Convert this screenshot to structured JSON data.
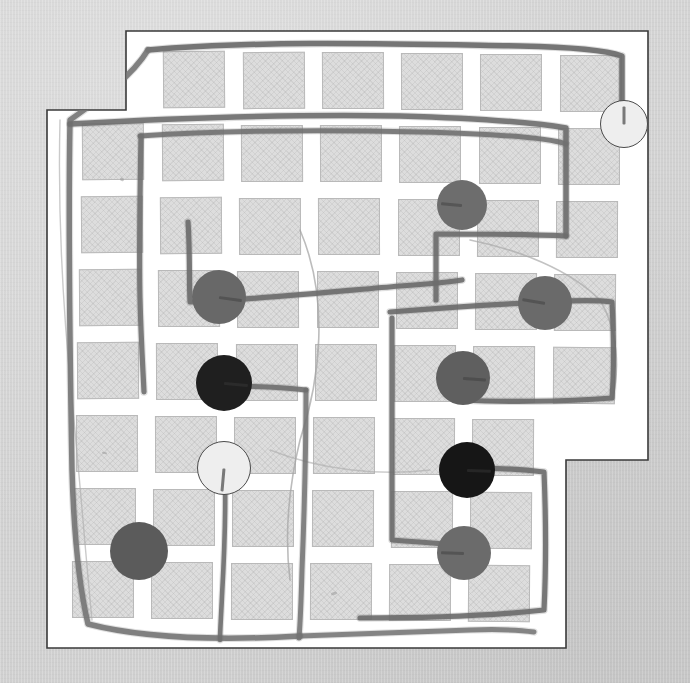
{
  "scene": {
    "title": "Hand-drawn grid map puzzle",
    "description": "Photograph of a white paper sheet on a gray surface showing a hatched city-block grid with pencil-drawn routes and colored game tokens placed at street intersections.",
    "canvas": {
      "width": 690,
      "height": 683
    },
    "backdrop_color": "#d3d3d3",
    "sheet_color": "#ffffff",
    "sheet_edge_color": "#3a3a3a",
    "block_fill": "#dddddd",
    "block_border": "#b9b9b9",
    "street_color": "#ffffff",
    "pencil_color": "#6f6f6f"
  },
  "sheet": {
    "label": "paper-sheet",
    "points": "126,31 648,31 648,460 566,460 566,648 47,648 47,110 126,110"
  },
  "grid": {
    "label": "city-block-grid",
    "columns": 7,
    "rows": 8,
    "origin_x": 84,
    "origin_y": 50,
    "cell_w": 79,
    "cell_h": 73,
    "block_w": 62,
    "block_h": 57,
    "skew_note": "blocks drift slightly left going down, mimicking a photographed page"
  },
  "tokens": [
    {
      "name": "token-white-top-right",
      "color": "#eeeeee",
      "outlined": true,
      "x": 624,
      "y": 124,
      "r": 24,
      "stub_deg": 270,
      "stub_len": 18,
      "order": 1
    },
    {
      "name": "token-gray-upper-mid",
      "color": "#6d6d6d",
      "outlined": false,
      "x": 462,
      "y": 205,
      "r": 25,
      "stub_deg": 185,
      "stub_len": 22,
      "order": 2
    },
    {
      "name": "token-gray-left-upper",
      "color": "#686868",
      "outlined": false,
      "x": 219,
      "y": 297,
      "r": 27,
      "stub_deg": 8,
      "stub_len": 26,
      "order": 3
    },
    {
      "name": "token-gray-right-mid",
      "color": "#6a6a6a",
      "outlined": false,
      "x": 545,
      "y": 303,
      "r": 27,
      "stub_deg": 190,
      "stub_len": 26,
      "order": 4
    },
    {
      "name": "token-black-left",
      "color": "#1f1f1f",
      "outlined": false,
      "x": 224,
      "y": 383,
      "r": 28,
      "stub_deg": 5,
      "stub_len": 26,
      "order": 5
    },
    {
      "name": "token-gray-right-low",
      "color": "#5f5f5f",
      "outlined": false,
      "x": 463,
      "y": 378,
      "r": 27,
      "stub_deg": 4,
      "stub_len": 26,
      "order": 6
    },
    {
      "name": "token-white-left-low",
      "color": "#eeeeee",
      "outlined": true,
      "x": 224,
      "y": 468,
      "r": 27,
      "stub_deg": 95,
      "stub_len": 24,
      "order": 7
    },
    {
      "name": "token-black-right-low",
      "color": "#161616",
      "outlined": false,
      "x": 467,
      "y": 470,
      "r": 28,
      "stub_deg": 2,
      "stub_len": 26,
      "order": 8
    },
    {
      "name": "token-gray-bottom-left",
      "color": "#5b5b5b",
      "outlined": false,
      "x": 139,
      "y": 551,
      "r": 29,
      "stub_deg": 0,
      "stub_len": 0,
      "order": 9
    },
    {
      "name": "token-gray-bottom-mid",
      "color": "#6b6b6b",
      "outlined": false,
      "x": 464,
      "y": 553,
      "r": 27,
      "stub_deg": 182,
      "stub_len": 26,
      "order": 10
    }
  ],
  "routes": [
    {
      "name": "route-outer-loop",
      "stroke": "#6b6b6b",
      "width": 5.5,
      "opacity": 0.92,
      "d": "M148,50 C260,40 400,44 520,46 C570,47 605,50 622,56 L622,110"
    },
    {
      "name": "route-left-spine",
      "stroke": "#757575",
      "width": 5.5,
      "opacity": 0.9,
      "d": "M148,50 C132,76 104,96 70,120 C68,230 70,360 72,470 C74,540 80,590 88,624 C150,640 230,640 300,636"
    },
    {
      "name": "route-upper-horizontal",
      "stroke": "#6e6e6e",
      "width": 5.5,
      "opacity": 0.9,
      "d": "M70,124 C180,118 300,114 400,116 C470,118 530,122 566,128 L566,236"
    },
    {
      "name": "route-second-horizontal",
      "stroke": "#6f6f6f",
      "width": 5.0,
      "opacity": 0.88,
      "d": "M140,136 C230,130 340,130 420,132 C500,134 548,138 566,144"
    },
    {
      "name": "route-col2-vertical",
      "stroke": "#707070",
      "width": 5.2,
      "opacity": 0.9,
      "d": "M141,136 C140,190 139,250 140,298 C141,340 143,370 144,392"
    },
    {
      "name": "route-mid-hook",
      "stroke": "#6c6c6c",
      "width": 5.2,
      "opacity": 0.9,
      "d": "M188,222 C190,250 189,280 190,302 C250,300 330,292 400,286 C430,284 450,282 462,280"
    },
    {
      "name": "route-right-upper-box",
      "stroke": "#6d6d6d",
      "width": 5.2,
      "opacity": 0.9,
      "d": "M566,236 C520,234 470,234 436,234 L436,300"
    },
    {
      "name": "route-right-mid-band",
      "stroke": "#6a6a6a",
      "width": 5.2,
      "opacity": 0.9,
      "d": "M390,312 C440,308 500,304 548,302 C580,300 598,300 612,302 C614,340 614,372 612,398 C560,402 500,402 462,400"
    },
    {
      "name": "route-center-vertical",
      "stroke": "#747474",
      "width": 5.0,
      "opacity": 0.88,
      "d": "M306,390 C306,450 304,520 302,570 C301,606 300,626 299,638"
    },
    {
      "name": "route-center-branch",
      "stroke": "#6f6f6f",
      "width": 5.0,
      "opacity": 0.9,
      "d": "M226,386 C260,386 288,388 306,390"
    },
    {
      "name": "route-lower-box",
      "stroke": "#6d6d6d",
      "width": 5.2,
      "opacity": 0.9,
      "d": "M392,318 C392,400 392,470 392,540 C420,542 446,544 462,546"
    },
    {
      "name": "route-lower-right-tail",
      "stroke": "#6b6b6b",
      "width": 5.2,
      "opacity": 0.9,
      "d": "M470,468 C500,468 528,470 544,472 C546,520 546,570 544,610 C490,616 420,618 360,618"
    },
    {
      "name": "route-bottom-edge",
      "stroke": "#737373",
      "width": 5.0,
      "opacity": 0.85,
      "d": "M300,636 C360,634 420,632 470,630 C500,629 520,630 534,632"
    },
    {
      "name": "route-white-token-tail",
      "stroke": "#6e6e6e",
      "width": 4.6,
      "opacity": 0.9,
      "d": "M225,478 C226,520 224,560 222,596 C221,618 220,632 220,640"
    }
  ],
  "faint_marks": [
    {
      "name": "faint-curve-center",
      "stroke": "#a6a6a6",
      "width": 1.6,
      "opacity": 0.75,
      "d": "M300,230 C330,300 320,380 300,440 C288,490 285,540 290,580"
    },
    {
      "name": "faint-curve-right",
      "stroke": "#a9a9a9",
      "width": 1.6,
      "opacity": 0.7,
      "d": "M470,240 C520,250 570,270 600,300 C618,330 620,370 612,400"
    },
    {
      "name": "faint-curve-left",
      "stroke": "#aeaeae",
      "width": 1.4,
      "opacity": 0.65,
      "d": "M60,120 C58,200 62,300 72,400 C80,480 86,560 92,620"
    },
    {
      "name": "faint-curve-lowermid",
      "stroke": "#ababab",
      "width": 1.4,
      "opacity": 0.6,
      "d": "M270,450 C320,470 380,476 430,470"
    }
  ],
  "smudges": [
    {
      "name": "smudge-upper-left",
      "x": 120,
      "y": 178,
      "w": 4,
      "h": 3,
      "rot": 25
    },
    {
      "name": "smudge-lower-mid",
      "x": 331,
      "y": 592,
      "w": 6,
      "h": 3,
      "rot": -15
    },
    {
      "name": "smudge-left-low",
      "x": 102,
      "y": 452,
      "w": 5,
      "h": 2,
      "rot": 10
    }
  ]
}
